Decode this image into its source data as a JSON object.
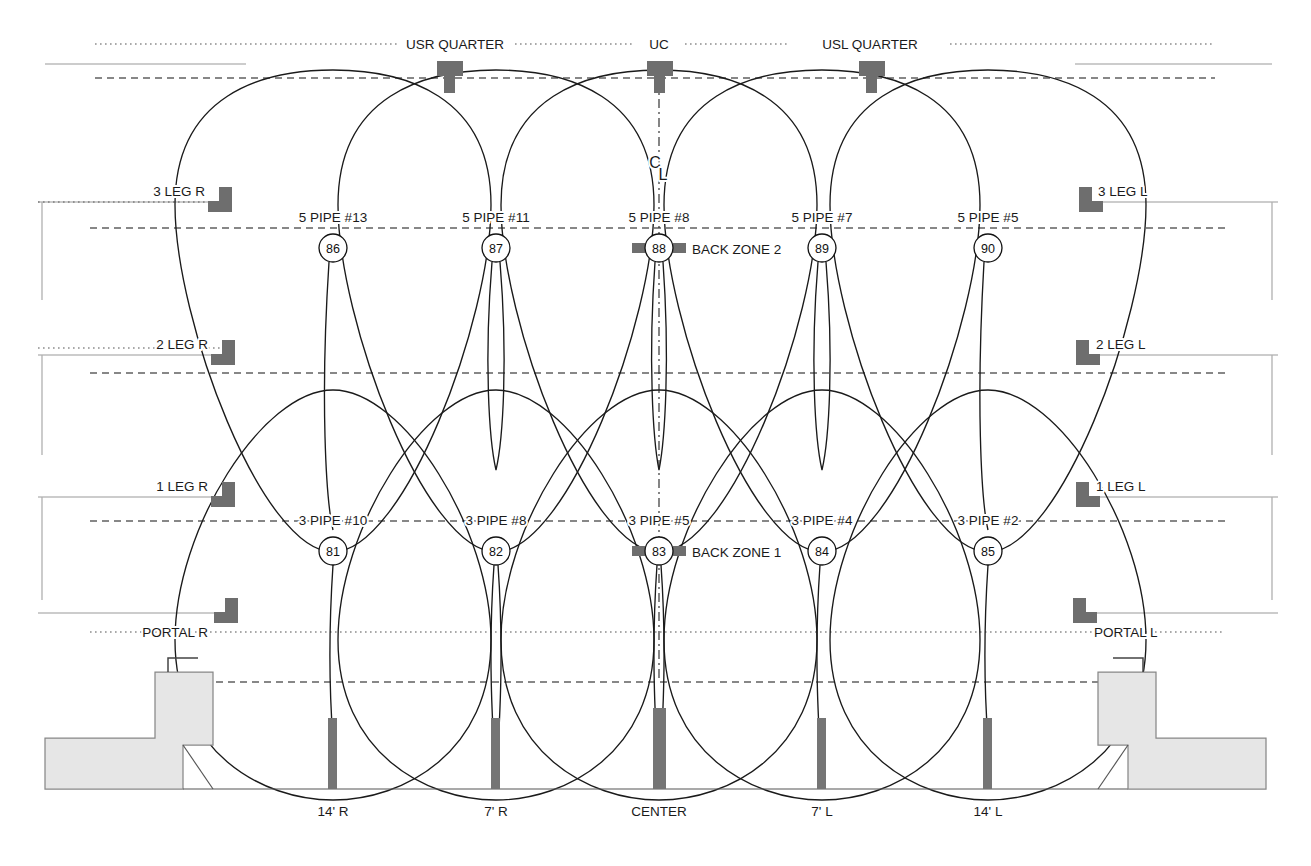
{
  "diagram": {
    "type": "beam-coverage-section"
  },
  "top_zone_labels": [
    {
      "name": "usr-quarter",
      "text": "USR QUARTER",
      "x": 455,
      "y": 48
    },
    {
      "name": "uc",
      "text": "UC",
      "x": 659,
      "y": 48
    },
    {
      "name": "usl-quarter",
      "text": "USL QUARTER",
      "x": 870,
      "y": 48
    }
  ],
  "centerline": {
    "label_top": "C",
    "label_bottom": "L",
    "x": 659
  },
  "leg_labels_right": [
    {
      "name": "3-leg-r",
      "text": "3 LEG R",
      "x": 200,
      "y": 195
    },
    {
      "name": "2-leg-r",
      "text": "2 LEG R",
      "x": 200,
      "y": 348
    },
    {
      "name": "1-leg-r",
      "text": "1 LEG R",
      "x": 200,
      "y": 490
    },
    {
      "name": "portal-r",
      "text": "PORTAL R",
      "x": 190,
      "y": 632
    }
  ],
  "leg_labels_left": [
    {
      "name": "3-leg-l",
      "text": "3 LEG L",
      "x": 1110,
      "y": 195
    },
    {
      "name": "2-leg-l",
      "text": "2 LEG L",
      "x": 1110,
      "y": 348
    },
    {
      "name": "1-leg-l",
      "text": "1 LEG L",
      "x": 1110,
      "y": 490
    },
    {
      "name": "portal-l",
      "text": "PORTAL L",
      "x": 1120,
      "y": 632
    }
  ],
  "back_zone_2": {
    "label": "BACK ZONE 2",
    "y_line": 228,
    "circle_y": 248,
    "pipes": [
      {
        "pipe": "5 PIPE #13",
        "number": "86",
        "x": 333
      },
      {
        "pipe": "5 PIPE #11",
        "number": "87",
        "x": 496
      },
      {
        "pipe": "5 PIPE #8",
        "number": "88",
        "x": 659
      },
      {
        "pipe": "5 PIPE #7",
        "number": "89",
        "x": 822
      },
      {
        "pipe": "5 PIPE #5",
        "number": "90",
        "x": 988
      }
    ]
  },
  "back_zone_1": {
    "label": "BACK ZONE 1",
    "y_line": 521,
    "circle_y": 551,
    "pipes": [
      {
        "pipe": "3 PIPE #10",
        "number": "81",
        "x": 333
      },
      {
        "pipe": "3 PIPE #8",
        "number": "82",
        "x": 496
      },
      {
        "pipe": "3 PIPE #5",
        "number": "83",
        "x": 659
      },
      {
        "pipe": "3 PIPE #4",
        "number": "84",
        "x": 822
      },
      {
        "pipe": "3 PIPE #2",
        "number": "85",
        "x": 988
      }
    ]
  },
  "bottom_positions": [
    {
      "name": "pos-14r",
      "text": "14' R",
      "x": 333,
      "bar_x": 328
    },
    {
      "name": "pos-7r",
      "text": "7' R",
      "x": 496,
      "bar_x": 491
    },
    {
      "name": "pos-center",
      "text": "CENTER",
      "x": 659,
      "bar_x": 653
    },
    {
      "name": "pos-7l",
      "text": "7' L",
      "x": 822,
      "bar_x": 817
    },
    {
      "name": "pos-14l",
      "text": "14' L",
      "x": 988,
      "bar_x": 983
    }
  ],
  "top_fixtures": [
    {
      "name": "fixture-usr-quarter",
      "x": 449,
      "y": 71
    },
    {
      "name": "fixture-uc",
      "x": 659,
      "y": 71
    },
    {
      "name": "fixture-usl-quarter",
      "x": 871,
      "y": 71
    }
  ],
  "colors": {
    "line": "#1a1a1a",
    "fixture": "#6e6e6e",
    "deck_fill": "#e6e6e6",
    "seat_bar": "#757575",
    "guide": "#9a9a9a"
  },
  "geometry": {
    "y_top_dot": 44,
    "y_top_thin": 64,
    "y_top_dash": 78,
    "y_zone2_thin": 202,
    "y_zone2_dash": 228,
    "y_leg2_thin": 355,
    "y_leg2_dash": 373,
    "y_leg1_thin": 497,
    "y_leg1_dash": 521,
    "y_portal_thin": 613,
    "y_portal_dash": 632,
    "y_deck_dash": 682,
    "y_floor": 789
  }
}
